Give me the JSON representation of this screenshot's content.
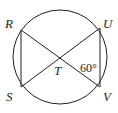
{
  "diagram": {
    "type": "circle-geometry",
    "stroke_color": "#231f20",
    "circle": {
      "cx": 60,
      "cy": 57,
      "r": 47
    },
    "points": [
      {
        "name": "R",
        "x": 21,
        "y": 30,
        "label_x": 5,
        "label_y": 28
      },
      {
        "name": "U",
        "x": 100,
        "y": 28,
        "label_x": 104,
        "label_y": 28
      },
      {
        "name": "S",
        "x": 21,
        "y": 87,
        "label_x": 6,
        "label_y": 101
      },
      {
        "name": "V",
        "x": 100,
        "y": 87,
        "label_x": 104,
        "label_y": 101
      },
      {
        "name": "T",
        "x": 60,
        "y": 58,
        "label_x": 55,
        "label_y": 74
      }
    ],
    "segments": [
      [
        "R",
        "S"
      ],
      [
        "U",
        "V"
      ],
      [
        "R",
        "V"
      ],
      [
        "S",
        "U"
      ]
    ],
    "angle_label": {
      "text": "60°",
      "x": 80,
      "y": 71
    }
  }
}
